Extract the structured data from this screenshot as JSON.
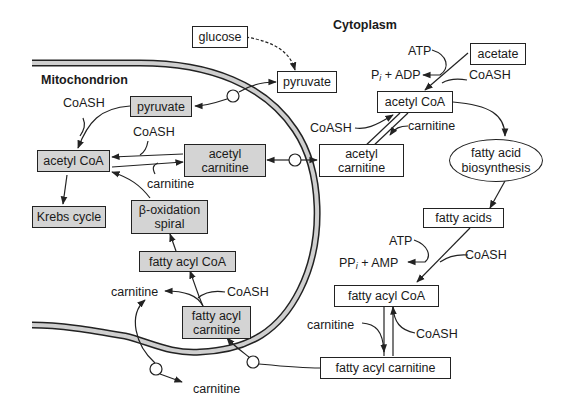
{
  "regions": {
    "cytoplasm": "Cytoplasm",
    "mitochondrion": "Mitochondrion"
  },
  "cytoplasm_nodes": {
    "glucose": "glucose",
    "pyruvate": "pyruvate",
    "acetate": "acetate",
    "acetyl_coa": "acetyl CoA",
    "acetyl_carnitine_1": "acetyl",
    "acetyl_carnitine_2": "carnitine",
    "fatty_acid_biosynthesis_1": "fatty acid",
    "fatty_acid_biosynthesis_2": "biosynthesis",
    "fatty_acids": "fatty acids",
    "fatty_acyl_coa": "fatty acyl CoA",
    "fatty_acyl_carnitine": "fatty acyl carnitine"
  },
  "mito_nodes": {
    "pyruvate": "pyruvate",
    "acetyl_coa": "acetyl CoA",
    "acetyl_carnitine_1": "acetyl",
    "acetyl_carnitine_2": "carnitine",
    "krebs_cycle": "Krebs cycle",
    "beta_oxidation_1": "β-oxidation",
    "beta_oxidation_2": "spiral",
    "fatty_acyl_coa": "fatty acyl CoA",
    "fatty_acyl_carnitine_1": "fatty acyl",
    "fatty_acyl_carnitine_2": "carnitine"
  },
  "labels": {
    "atp_top": "ATP",
    "pi_adp_p": "P",
    "pi_adp_sub": "i",
    "pi_adp_rest": " + ADP",
    "coash_acetate": "CoASH",
    "coash_cyto_acetyl": "CoASH",
    "carnitine_cyto_acetyl": "carnitine",
    "atp_bottom": "ATP",
    "ppi_amp_p": "PP",
    "ppi_amp_sub": "i",
    "ppi_amp_rest": " + AMP",
    "coash_fatty_acids": "CoASH",
    "carnitine_cyto_fatty": "carnitine",
    "coash_cyto_fatty": "CoASH",
    "coash_mito_pyruvate": "CoASH",
    "coash_mito_acetyl": "CoASH",
    "carnitine_mito_acetyl": "carnitine",
    "carnitine_mito_fatty": "carnitine",
    "coash_mito_fatty": "CoASH",
    "carnitine_bottom": "carnitine"
  },
  "colors": {
    "mito_box_fill": "#d4d4d4",
    "membrane_fill": "#cfcfcf",
    "line": "#222222"
  }
}
